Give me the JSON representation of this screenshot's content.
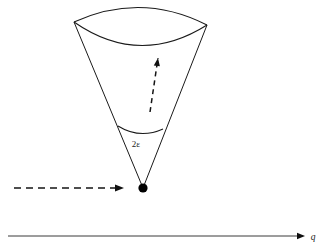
{
  "figure": {
    "kind": "scattering-cone-diagram",
    "background_color": "#ffffff",
    "ink_color": "#1a1a1a",
    "width": 327,
    "height": 251,
    "labels": {
      "cone_angle": "2ε",
      "axis": "q"
    },
    "elements": {
      "cone": {
        "name": "cone",
        "apex": {
          "x": 143,
          "y": 188
        },
        "rim_left": {
          "x": 74,
          "y": 22
        },
        "rim_right": {
          "x": 207,
          "y": 25
        },
        "rim_front_sag": 22,
        "rim_back_sag": -16
      },
      "angle_arc": {
        "name": "angle-arc",
        "left": {
          "x": 118,
          "y": 126
        },
        "right": {
          "x": 163,
          "y": 129
        },
        "sag": 6
      },
      "angle_label": {
        "name": "cone-angle-label",
        "x": 136,
        "y": 147
      },
      "inner_arrow": {
        "name": "cone-axis-arrow",
        "from": {
          "x": 150,
          "y": 112
        },
        "to": {
          "x": 158,
          "y": 58
        },
        "style": "dashed"
      },
      "incoming_arrow": {
        "name": "incoming-beam-arrow",
        "from": {
          "x": 14,
          "y": 188
        },
        "to": {
          "x": 124,
          "y": 188
        },
        "style": "dashed"
      },
      "q_axis": {
        "name": "q-axis",
        "from": {
          "x": 8,
          "y": 236
        },
        "to": {
          "x": 305,
          "y": 236
        },
        "style": "solid"
      },
      "q_axis_label": {
        "name": "q-axis-label",
        "x": 313,
        "y": 240
      }
    }
  }
}
